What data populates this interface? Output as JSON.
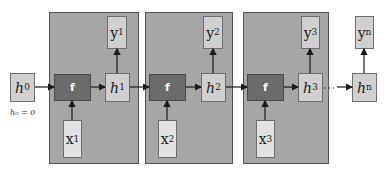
{
  "diagram": {
    "type": "unrolled-rnn",
    "initial_state": {
      "var": "h",
      "sub": "0",
      "note": "h₀ = 0"
    },
    "cells": [
      {
        "function": "f",
        "input": {
          "var": "x",
          "sub": "1"
        },
        "hidden": {
          "var": "h",
          "sub": "1"
        },
        "output": {
          "var": "y",
          "sub": "1"
        }
      },
      {
        "function": "f",
        "input": {
          "var": "x",
          "sub": "2"
        },
        "hidden": {
          "var": "h",
          "sub": "2"
        },
        "output": {
          "var": "y",
          "sub": "2"
        }
      },
      {
        "function": "f",
        "input": {
          "var": "x",
          "sub": "3"
        },
        "hidden": {
          "var": "h",
          "sub": "3"
        },
        "output": {
          "var": "y",
          "sub": "3"
        }
      }
    ],
    "final": {
      "hidden": {
        "var": "h",
        "sub": "n"
      },
      "output": {
        "var": "y",
        "sub": "n"
      }
    },
    "ellipsis": "· · ·",
    "colors": {
      "cell_bg": "#a6a6a6",
      "f_box": "#6b6b6b",
      "state_box": "#d0d0d0",
      "input_box": "#e2e2e2"
    }
  }
}
